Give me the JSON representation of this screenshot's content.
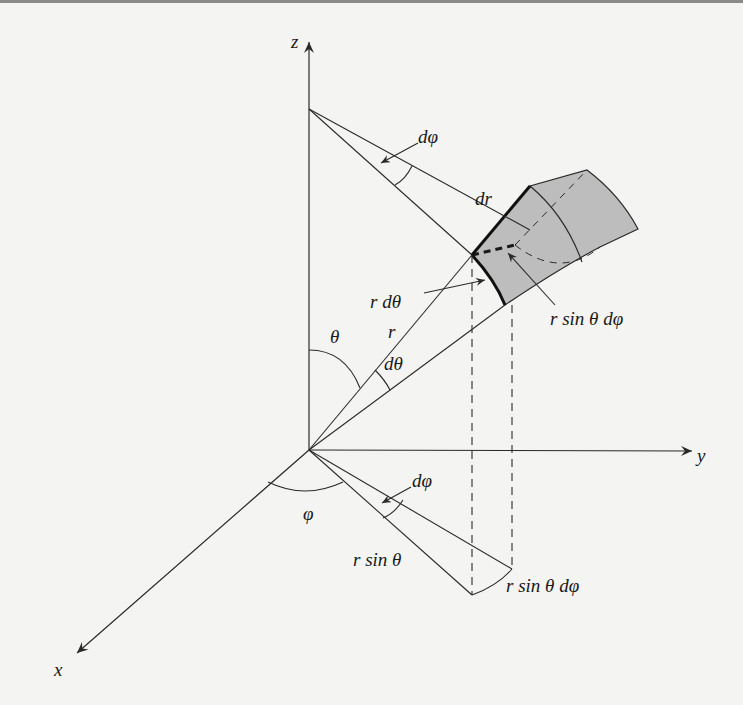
{
  "figure": {
    "type": "spherical coordinates volume element",
    "axes": {
      "z": "z",
      "y": "y",
      "x": "x"
    },
    "labels": {
      "dphi_top": "dφ",
      "dr": "dr",
      "r_dtheta": "r dθ",
      "r": "r",
      "theta": "θ",
      "dtheta": "dθ",
      "r_sin_theta_dphi_upper": "r sin θ dφ",
      "dphi_bottom": "dφ",
      "phi": "φ",
      "r_sin_theta": "r sin θ",
      "r_sin_theta_dphi_lower": "r sin θ dφ"
    },
    "colors": {
      "line": "#2a2a2a",
      "shade": "#bdbdbd",
      "background": "#f4f4f2"
    }
  }
}
